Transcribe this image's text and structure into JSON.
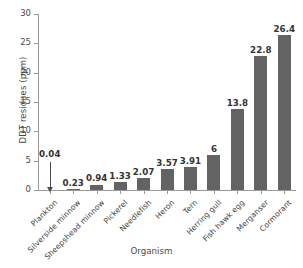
{
  "chart_data": {
    "type": "bar",
    "title": "",
    "xlabel": "Organism",
    "ylabel": "DDT residues (ppm)",
    "categories": [
      "Plankton",
      "Silverside minnow",
      "Sheepshead minnow",
      "Pickerel",
      "Needlefish",
      "Heron",
      "Tern",
      "Herring gull",
      "Fish hawk egg",
      "Merganser",
      "Cormorant"
    ],
    "values": [
      0.04,
      0.23,
      0.94,
      1.33,
      2.07,
      3.57,
      3.91,
      6,
      13.8,
      22.8,
      26.4
    ],
    "value_labels": [
      "0.04",
      "0.23",
      "0.94",
      "1.33",
      "2.07",
      "3.57",
      "3.91",
      "6",
      "13.8",
      "22.8",
      "26.4"
    ],
    "ylim": [
      0,
      30
    ],
    "yticks": [
      0,
      5,
      10,
      15,
      20,
      25,
      30
    ],
    "ytick_labels": [
      "0",
      "5",
      "10",
      "15",
      "20",
      "25",
      "30"
    ],
    "grid": false,
    "legend": false,
    "bar_color": "#636363",
    "axis_color": "#9a9a9a",
    "text_color": "#3a3a3a",
    "background_color": "#ffffff",
    "annotations": [
      {
        "target_category": "Plankton",
        "text": "0.04",
        "style": "arrow-down",
        "note": "bar too small to see; label with downward arrow pointing to baseline"
      }
    ]
  }
}
